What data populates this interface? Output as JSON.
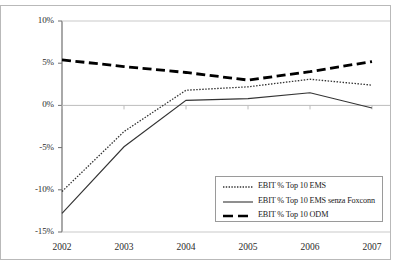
{
  "chart_data": {
    "type": "line",
    "title": "",
    "subtitle": "",
    "xlabel": "",
    "ylabel": "",
    "categories": [
      "2002",
      "2003",
      "2004",
      "2005",
      "2006",
      "2007"
    ],
    "x_tick_labels": [
      "2002",
      "2003",
      "2004",
      "2005",
      "2006",
      "2007"
    ],
    "y_tick_labels": [
      "10%",
      "5%",
      "0%",
      "-5%",
      "-10%",
      "-15%"
    ],
    "y_tick_values": [
      10,
      5,
      0,
      -5,
      -10,
      -15
    ],
    "ylim": [
      -15,
      10
    ],
    "grid": false,
    "zero_line": true,
    "legend_position": "bottom-right",
    "series": [
      {
        "name": "EBIT % Top 10 EMS",
        "style": "dotted",
        "color": "#333333",
        "values": [
          -10.2,
          -3.1,
          1.8,
          2.2,
          3.1,
          2.4
        ]
      },
      {
        "name": "EBIT % Top 10 EMS senza Foxconn",
        "style": "solid",
        "color": "#333333",
        "values": [
          -12.8,
          -4.9,
          0.6,
          0.8,
          1.5,
          -0.3
        ]
      },
      {
        "name": "EBIT % Top 10 ODM",
        "style": "dashed",
        "color": "#000000",
        "values": [
          5.4,
          4.6,
          3.9,
          3.0,
          4.0,
          5.2
        ]
      }
    ]
  },
  "legend": {
    "entries": [
      {
        "label": "EBIT % Top 10 EMS"
      },
      {
        "label": "EBIT % Top 10 EMS senza Foxconn"
      },
      {
        "label": "EBIT % Top 10 ODM"
      }
    ]
  }
}
